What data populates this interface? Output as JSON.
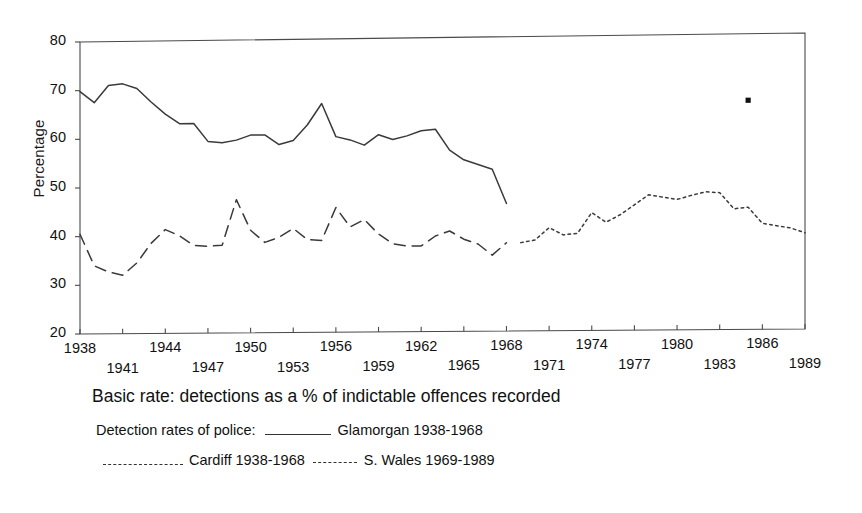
{
  "figure": {
    "ylabel": "Percentage",
    "caption": "Basic rate: detections as a % of indictable offences recorded",
    "legend": {
      "intro": "Detection rates of police:",
      "glamorgan": "Glamorgan 1938-1968",
      "cardiff": "Cardiff 1938-1968",
      "swales": "S. Wales 1969-1989",
      "swatch_solid": "solid-line-swatch",
      "swatch_dashed": "dashed-line-swatch",
      "swatch_dotted": "dotted-line-swatch"
    }
  },
  "chart_data": {
    "type": "line",
    "title": "Basic rate: detections as a % of indictable offences recorded",
    "xlabel": "",
    "ylabel": "Percentage",
    "ylim": [
      20,
      80
    ],
    "xlim": [
      1938,
      1989
    ],
    "yticks": [
      20,
      30,
      40,
      50,
      60,
      70,
      80
    ],
    "xticks": [
      1938,
      1941,
      1944,
      1947,
      1950,
      1953,
      1956,
      1959,
      1962,
      1965,
      1968,
      1971,
      1974,
      1977,
      1980,
      1983,
      1986,
      1989
    ],
    "xticks_upper": [
      1938,
      1944,
      1950,
      1956,
      1962,
      1968,
      1974,
      1980,
      1986
    ],
    "xticks_lower": [
      1941,
      1947,
      1953,
      1959,
      1965,
      1971,
      1977,
      1983,
      1989
    ],
    "grid": false,
    "legend_position": "below-plot",
    "series": [
      {
        "name": "Glamorgan 1938-1968",
        "style": "solid",
        "x": [
          1938,
          1939,
          1940,
          1941,
          1942,
          1943,
          1944,
          1945,
          1946,
          1947,
          1948,
          1949,
          1950,
          1951,
          1952,
          1953,
          1954,
          1955,
          1956,
          1957,
          1958,
          1959,
          1960,
          1961,
          1962,
          1963,
          1964,
          1965,
          1966,
          1967,
          1968
        ],
        "values": [
          69.8,
          67.5,
          71.0,
          71.3,
          70.3,
          67.5,
          65.0,
          63.0,
          63.0,
          59.3,
          59.0,
          59.5,
          60.5,
          60.5,
          58.5,
          59.3,
          62.5,
          66.8,
          60.0,
          59.3,
          58.2,
          60.3,
          59.3,
          60.0,
          61.0,
          61.3,
          57.0,
          55.0,
          54.0,
          53.0,
          46.0
        ]
      },
      {
        "name": "Cardiff 1938-1968",
        "style": "dashed",
        "x": [
          1938,
          1939,
          1940,
          1941,
          1942,
          1943,
          1944,
          1945,
          1946,
          1947,
          1948,
          1949,
          1950,
          1951,
          1952,
          1953,
          1954,
          1955,
          1956,
          1957,
          1958,
          1959,
          1960,
          1961,
          1962,
          1963,
          1964,
          1965,
          1966,
          1967,
          1968
        ],
        "values": [
          40.5,
          34.0,
          32.7,
          32.0,
          34.5,
          38.5,
          41.3,
          40.0,
          38.0,
          37.8,
          38.0,
          47.3,
          41.0,
          38.5,
          39.5,
          41.3,
          39.0,
          38.8,
          45.5,
          41.5,
          43.0,
          40.0,
          38.0,
          37.5,
          37.5,
          39.5,
          40.5,
          38.8,
          37.8,
          35.5,
          38.0
        ]
      },
      {
        "name": "S. Wales 1969-1989",
        "style": "dotted",
        "x": [
          1969,
          1970,
          1971,
          1972,
          1973,
          1974,
          1975,
          1976,
          1977,
          1978,
          1979,
          1980,
          1981,
          1982,
          1983,
          1984,
          1985,
          1986,
          1987,
          1988,
          1989
        ],
        "values": [
          38.0,
          38.5,
          41.0,
          39.5,
          39.8,
          44.0,
          42.0,
          43.5,
          45.5,
          47.5,
          47.0,
          46.5,
          47.3,
          48.0,
          47.8,
          44.5,
          44.8,
          41.5,
          41.0,
          40.5,
          39.5
        ]
      }
    ],
    "stray_mark": {
      "x": 1985,
      "y": 66.5,
      "style": "square-dot"
    }
  }
}
